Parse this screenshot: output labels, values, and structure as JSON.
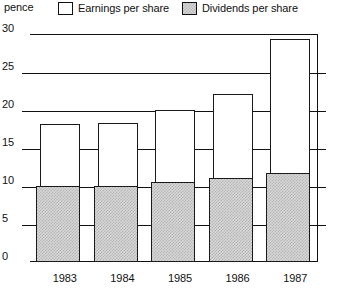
{
  "legend": {
    "unit_label": "pence",
    "entries": [
      {
        "label": "Earnings per share",
        "swatch": "white-square-icon"
      },
      {
        "label": "Dividends per share",
        "swatch": "shaded-square-icon"
      }
    ]
  },
  "axis": {
    "y_ticks": [
      "0",
      "5",
      "10",
      "15",
      "20",
      "25",
      "30"
    ],
    "x_ticks": [
      "1983",
      "1984",
      "1985",
      "1986",
      "1987"
    ]
  },
  "chart_data": {
    "type": "bar",
    "title": "",
    "subtitle": "",
    "xlabel": "",
    "ylabel": "pence",
    "ylim": [
      0,
      30
    ],
    "y_ticks": [
      0,
      5,
      10,
      15,
      20,
      25,
      30
    ],
    "grid": true,
    "legend_position": "top",
    "categories": [
      "1983",
      "1984",
      "1985",
      "1986",
      "1987"
    ],
    "series": [
      {
        "name": "Earnings per share",
        "values": [
          18.2,
          18.3,
          20.0,
          22.1,
          29.4
        ]
      },
      {
        "name": "Dividends per share",
        "values": [
          10.0,
          10.0,
          10.5,
          11.0,
          11.7
        ]
      }
    ],
    "colors": {
      "earnings": "#ffffff",
      "dividends": "#d8d8d8",
      "outline": "#111111"
    }
  }
}
